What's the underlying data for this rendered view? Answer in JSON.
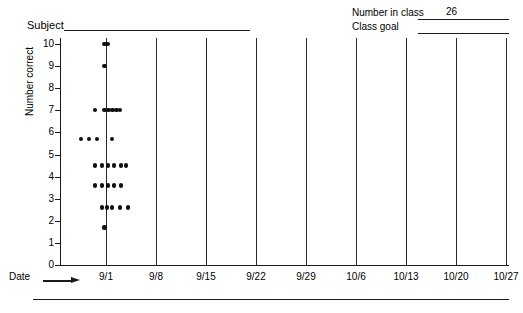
{
  "header": {
    "subject_label": "Subject",
    "subject_value": "",
    "number_in_class_label": "Number in class",
    "number_in_class_value": "26",
    "class_goal_label": "Class goal",
    "class_goal_value": ""
  },
  "axes": {
    "y_title": "Number correct",
    "y_ticks": [
      "10",
      "9",
      "8",
      "7",
      "6",
      "5",
      "4",
      "3",
      "2",
      "1",
      "0"
    ],
    "x_title": "Date",
    "x_arrow_icon": "right-arrow-icon",
    "x_ticks": [
      "9/1",
      "9/8",
      "9/15",
      "9/22",
      "9/29",
      "10/6",
      "10/13",
      "10/20",
      "10/27"
    ]
  },
  "caption": {
    "text": ""
  },
  "chart_data": {
    "type": "scatter",
    "title": "",
    "subtitle": "",
    "xlabel": "Date",
    "ylabel": "Number correct",
    "ylim": [
      0,
      10
    ],
    "yticks": [
      0,
      1,
      2,
      3,
      4,
      5,
      6,
      7,
      8,
      9,
      10
    ],
    "categories": [
      "9/1",
      "9/8",
      "9/15",
      "9/22",
      "9/29",
      "10/6",
      "10/13",
      "10/20",
      "10/27"
    ],
    "grid": "vertical-gridline-per-date",
    "legend": "none",
    "annotations": {
      "number_in_class": 26,
      "class_goal": null
    },
    "series": [
      {
        "name": "9/1 student scores",
        "x_category": "9/1",
        "total_points": 30,
        "clusters": [
          {
            "value": 10.0,
            "count": 2,
            "offsets": [
              -1.5,
              1.5
            ]
          },
          {
            "value": 9.0,
            "count": 1,
            "offsets": [
              -1.5
            ]
          },
          {
            "value": 7.0,
            "count": 6,
            "offsets": [
              -11,
              -1.5,
              2.5,
              6.5,
              10.5,
              14
            ]
          },
          {
            "value": 5.7,
            "count": 4,
            "offsets": [
              -25,
              -17,
              -9,
              6
            ]
          },
          {
            "value": 4.5,
            "count": 6,
            "offsets": [
              -11,
              -4,
              2,
              8,
              15,
              20
            ]
          },
          {
            "value": 3.6,
            "count": 5,
            "offsets": [
              -11,
              -4,
              2,
              8,
              15
            ]
          },
          {
            "value": 2.6,
            "count": 5,
            "offsets": [
              -4,
              1,
              6,
              14,
              22
            ]
          },
          {
            "value": 1.7,
            "count": 1,
            "offsets": [
              -1.5
            ]
          }
        ]
      }
    ]
  }
}
